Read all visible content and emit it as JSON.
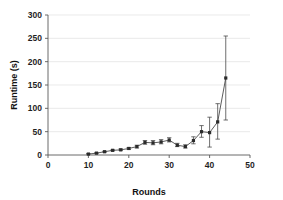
{
  "chart_data": {
    "type": "line",
    "title": "",
    "xlabel": "Rounds",
    "ylabel": "Runtime (s)",
    "xlim": [
      0,
      50
    ],
    "ylim": [
      0,
      300
    ],
    "xticks": [
      0,
      10,
      20,
      30,
      40,
      50
    ],
    "yticks": [
      0,
      50,
      100,
      150,
      200,
      250,
      300
    ],
    "xtick_labels": [
      "0",
      "10",
      "20",
      "30",
      "40",
      "50"
    ],
    "ytick_labels": [
      "0",
      "50",
      "100",
      "150",
      "200",
      "250",
      "300"
    ],
    "grid": "horizontal",
    "legend": "none",
    "marker": "square",
    "error_bars": "vertical",
    "x": [
      10,
      12,
      14,
      16,
      18,
      20,
      22,
      24,
      26,
      28,
      30,
      32,
      34,
      36,
      38,
      40,
      42,
      44
    ],
    "values": [
      2,
      4,
      7,
      10,
      11,
      14,
      18,
      27,
      26,
      28,
      32,
      21,
      18,
      31,
      50,
      48,
      71,
      165
    ],
    "series": [
      {
        "name": "Runtime",
        "color": "#3a3a3a",
        "values": [
          2,
          4,
          7,
          10,
          11,
          14,
          18,
          27,
          26,
          28,
          32,
          21,
          18,
          31,
          50,
          48,
          71,
          165
        ],
        "err_low": [
          2,
          3,
          6,
          9,
          10,
          12,
          15,
          23,
          22,
          24,
          28,
          18,
          15,
          24,
          38,
          17,
          34,
          75
        ],
        "err_high": [
          3,
          5,
          8,
          11,
          13,
          16,
          21,
          31,
          31,
          33,
          37,
          25,
          22,
          39,
          63,
          81,
          110,
          255
        ]
      }
    ],
    "annotations": []
  },
  "axis": {
    "x_title": "Rounds",
    "y_title": "Runtime (s)"
  }
}
